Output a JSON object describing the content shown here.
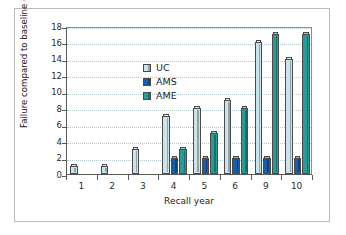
{
  "chart_data": {
    "type": "bar",
    "title": "",
    "xlabel": "Recall year",
    "ylabel": "Failure compared to baseline (%)",
    "categories": [
      "1",
      "2",
      "3",
      "4",
      "5",
      "6",
      "9",
      "10"
    ],
    "ylim": [
      0,
      18
    ],
    "ytick_step": 2,
    "yticks": [
      "18",
      "16",
      "14",
      "12",
      "10",
      "8",
      "6",
      "4",
      "2",
      "0"
    ],
    "grid": "horizontal dotted",
    "legend_position": "top-left inside plot",
    "series": [
      {
        "name": "UC",
        "color": "#cde3ea",
        "values": [
          1,
          1,
          3,
          7,
          8,
          9,
          16,
          14
        ]
      },
      {
        "name": "AMS",
        "color": "#1b5ea8",
        "values": [
          0,
          0,
          0,
          2,
          2,
          2,
          2,
          2
        ]
      },
      {
        "name": "AME",
        "color": "#2e9a96",
        "values": [
          0,
          0,
          0,
          3,
          5,
          8,
          17,
          17
        ]
      }
    ]
  },
  "legend": {
    "items": [
      {
        "label": "UC"
      },
      {
        "label": "AMS"
      },
      {
        "label": "AME"
      }
    ]
  },
  "colors": {
    "uc": "#cde3ea",
    "ams": "#1b5ea8",
    "ame": "#2e9a96",
    "axis": "#595959",
    "grid": "#b6c9cf",
    "frame": "#b9b9b9",
    "text": "#222222"
  }
}
